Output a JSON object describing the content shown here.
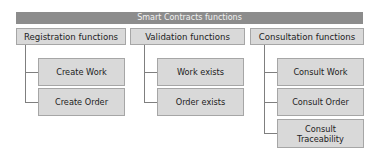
{
  "diagram": {
    "title": "Smart Contracts functions",
    "categories": [
      {
        "label": "Registration functions",
        "children": [
          "Create Work",
          "Create Order"
        ]
      },
      {
        "label": "Validation functions",
        "children": [
          "Work exists",
          "Order exists"
        ]
      },
      {
        "label": "Consultation functions",
        "children": [
          "Consult Work",
          "Consult Order",
          "Consult Traceability"
        ]
      }
    ],
    "colors": {
      "banner": "#8c8c8c",
      "box_fill": "#d9d9d9",
      "box_border": "#a6a6a6",
      "connector": "#7f7f7f"
    }
  }
}
